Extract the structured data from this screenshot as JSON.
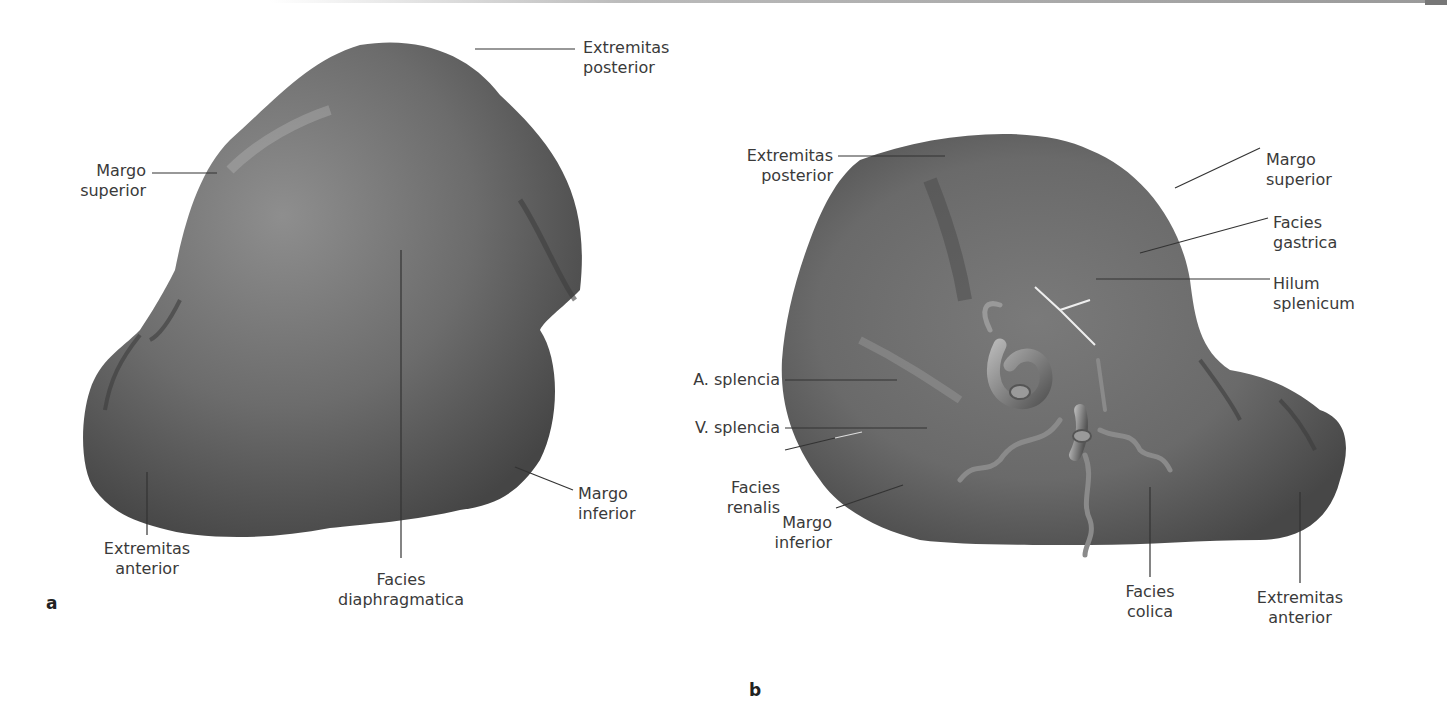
{
  "figure": {
    "panel_a": {
      "letter": "a",
      "labels": {
        "extremitas_posterior": [
          "Extremitas",
          "posterior"
        ],
        "margo_superior": [
          "Margo",
          "superior"
        ],
        "extremitas_anterior": [
          "Extremitas",
          "anterior"
        ],
        "facies_diaphragmatica": [
          "Facies",
          "diaphragmatica"
        ],
        "margo_inferior": [
          "Margo",
          "inferior"
        ]
      }
    },
    "panel_b": {
      "letter": "b",
      "labels": {
        "extremitas_posterior": [
          "Extremitas",
          "posterior"
        ],
        "margo_superior": [
          "Margo",
          "superior"
        ],
        "facies_gastrica": [
          "Facies",
          "gastrica"
        ],
        "hilum_splenicum": [
          "Hilum",
          "splenicum"
        ],
        "a_splencia": [
          "A. splencia"
        ],
        "v_splencia": [
          "V. splencia"
        ],
        "facies_renalis": [
          "Facies",
          "renalis"
        ],
        "margo_inferior": [
          "Margo",
          "inferior"
        ],
        "facies_colica": [
          "Facies",
          "colica"
        ],
        "extremitas_anterior": [
          "Extremitas",
          "anterior"
        ]
      }
    }
  },
  "colors": {
    "organ_dark": "#4a4a4a",
    "organ_mid": "#707070",
    "organ_light": "#9a9a9a",
    "leader_line": "#333333",
    "label_text": "#3a3a3a"
  }
}
